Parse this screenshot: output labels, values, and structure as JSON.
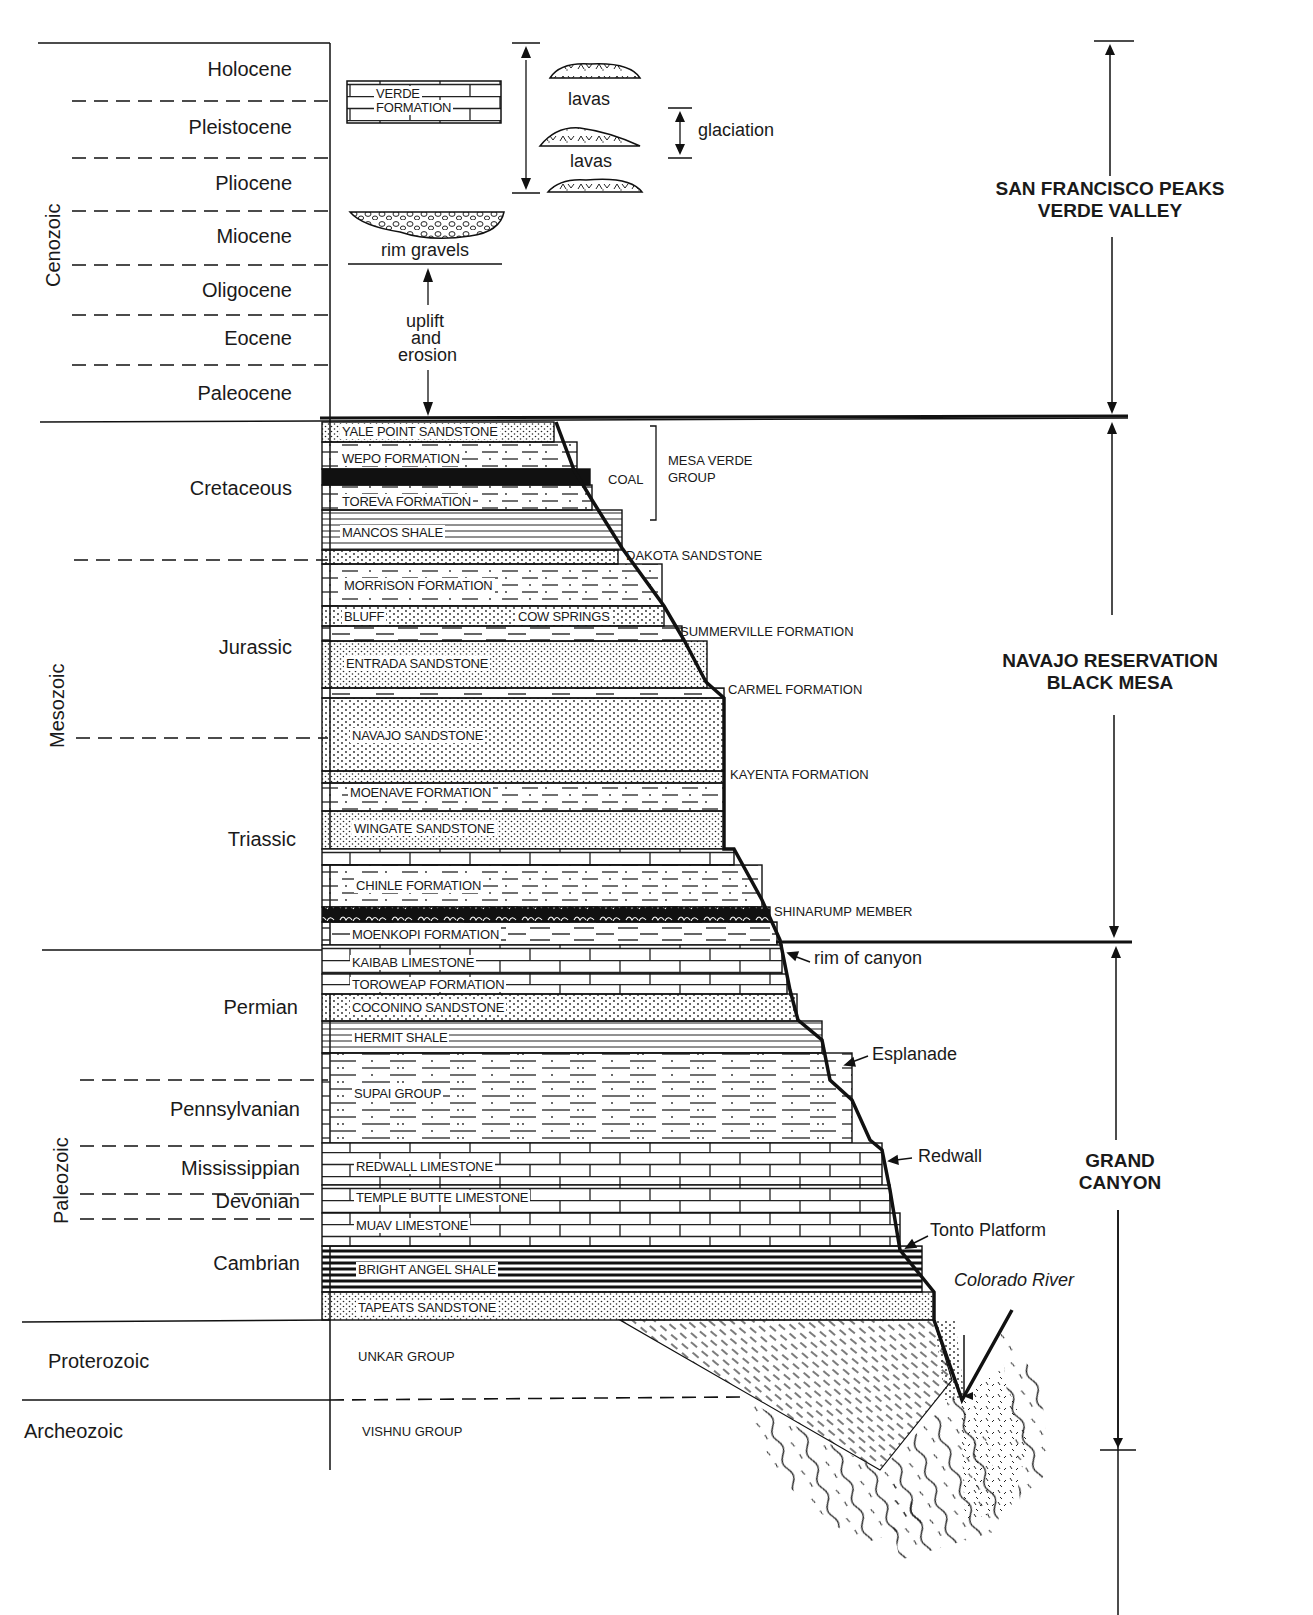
{
  "diagram": {
    "type": "stratigraphic-column",
    "eras": [
      {
        "label": "Cenozoic",
        "orientation": "vertical"
      },
      {
        "label": "Mesozoic",
        "orientation": "vertical"
      },
      {
        "label": "Paleozoic",
        "orientation": "vertical"
      },
      {
        "label": "Proterozoic",
        "orientation": "horizontal"
      },
      {
        "label": "Archeozoic",
        "orientation": "horizontal"
      }
    ],
    "periods": [
      {
        "label": "Holocene",
        "era": "Cenozoic"
      },
      {
        "label": "Pleistocene",
        "era": "Cenozoic"
      },
      {
        "label": "Pliocene",
        "era": "Cenozoic"
      },
      {
        "label": "Miocene",
        "era": "Cenozoic"
      },
      {
        "label": "Oligocene",
        "era": "Cenozoic"
      },
      {
        "label": "Eocene",
        "era": "Cenozoic"
      },
      {
        "label": "Paleocene",
        "era": "Cenozoic"
      },
      {
        "label": "Cretaceous",
        "era": "Mesozoic"
      },
      {
        "label": "Jurassic",
        "era": "Mesozoic"
      },
      {
        "label": "Triassic",
        "era": "Mesozoic"
      },
      {
        "label": "Permian",
        "era": "Paleozoic"
      },
      {
        "label": "Pennsylvanian",
        "era": "Paleozoic"
      },
      {
        "label": "Mississippian",
        "era": "Paleozoic"
      },
      {
        "label": "Devonian",
        "era": "Paleozoic"
      },
      {
        "label": "Cambrian",
        "era": "Paleozoic"
      }
    ],
    "cenozoic_features": {
      "verde_formation": "VERDE\nFORMATION",
      "verde_line1": "VERDE",
      "verde_line2": "FORMATION",
      "lavas_upper": "lavas",
      "lavas_lower": "lavas",
      "glaciation": "glaciation",
      "rim_gravels": "rim gravels",
      "uplift_line1": "uplift",
      "uplift_line2": "and",
      "uplift_line3": "erosion"
    },
    "formations": [
      {
        "label": "YALE POINT SANDSTONE",
        "pattern": "sandstone"
      },
      {
        "label": "WEPO FORMATION",
        "pattern": "shale-sand"
      },
      {
        "label": "COAL",
        "pattern": "coal",
        "side_label": true
      },
      {
        "label": "TOREVA FORMATION",
        "pattern": "shale-sand"
      },
      {
        "label": "MANCOS SHALE",
        "pattern": "shale"
      },
      {
        "label": "DAKOTA SANDSTONE",
        "pattern": "sandstone",
        "side_label": true
      },
      {
        "label": "MORRISON FORMATION",
        "pattern": "shale-sand"
      },
      {
        "label": "BLUFF",
        "pattern": "sandstone"
      },
      {
        "label": "COW SPRINGS",
        "pattern": "sandstone"
      },
      {
        "label": "SUMMERVILLE FORMATION",
        "pattern": "dashed",
        "side_label": true
      },
      {
        "label": "ENTRADA SANDSTONE",
        "pattern": "sandstone"
      },
      {
        "label": "CARMEL FORMATION",
        "pattern": "dashed",
        "side_label": true
      },
      {
        "label": "NAVAJO SANDSTONE",
        "pattern": "sandstone"
      },
      {
        "label": "KAYENTA FORMATION",
        "pattern": "sandstone",
        "side_label": true
      },
      {
        "label": "MOENAVE FORMATION",
        "pattern": "shale-sand"
      },
      {
        "label": "WINGATE SANDSTONE",
        "pattern": "sandstone"
      },
      {
        "label": "CHINLE FORMATION",
        "pattern": "shale-sand"
      },
      {
        "label": "SHINARUMP MEMBER",
        "pattern": "conglomerate",
        "side_label": true
      },
      {
        "label": "MOENKOPI FORMATION",
        "pattern": "dashed"
      },
      {
        "label": "KAIBAB LIMESTONE",
        "pattern": "limestone"
      },
      {
        "label": "TOROWEAP FORMATION",
        "pattern": "limestone"
      },
      {
        "label": "COCONINO SANDSTONE",
        "pattern": "sandstone"
      },
      {
        "label": "HERMIT SHALE",
        "pattern": "shale"
      },
      {
        "label": "SUPAI GROUP",
        "pattern": "dash-dot"
      },
      {
        "label": "REDWALL LIMESTONE",
        "pattern": "limestone"
      },
      {
        "label": "TEMPLE BUTTE LIMESTONE",
        "pattern": "limestone"
      },
      {
        "label": "MUAV LIMESTONE",
        "pattern": "limestone"
      },
      {
        "label": "BRIGHT ANGEL SHALE",
        "pattern": "dark-shale"
      },
      {
        "label": "TAPEATS SANDSTONE",
        "pattern": "sandstone"
      },
      {
        "label": "UNKAR GROUP",
        "pattern": "tilted"
      },
      {
        "label": "VISHNU GROUP",
        "pattern": "schist"
      }
    ],
    "group_bracket": {
      "label_line1": "MESA VERDE",
      "label_line2": "GROUP"
    },
    "landmarks": [
      {
        "label": "rim of canyon"
      },
      {
        "label": "Esplanade"
      },
      {
        "label": "Redwall"
      },
      {
        "label": "Tonto Platform"
      },
      {
        "label": "Colorado River",
        "italic": true
      }
    ],
    "regions": [
      {
        "line1": "SAN FRANCISCO PEAKS",
        "line2": "VERDE VALLEY"
      },
      {
        "line1": "NAVAJO RESERVATION",
        "line2": "BLACK MESA"
      },
      {
        "line1": "GRAND",
        "line2": "CANYON"
      }
    ],
    "colors": {
      "ink": "#111111",
      "paper": "#ffffff"
    }
  }
}
